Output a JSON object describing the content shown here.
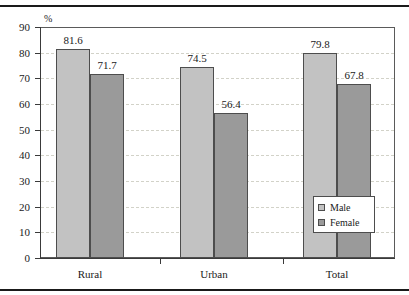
{
  "chart_data": {
    "type": "bar",
    "title": "",
    "xlabel": "",
    "ylabel": "%",
    "ylim": [
      0,
      90
    ],
    "ytick_step": 10,
    "yticks": [
      "90",
      "80",
      "70",
      "60",
      "50",
      "40",
      "30",
      "20",
      "10",
      "0"
    ],
    "grid": true,
    "legend_position": "inside-bottom-right",
    "categories": [
      "Rural",
      "Urban",
      "Total"
    ],
    "series": [
      {
        "name": "Male",
        "values": [
          81.6,
          74.5,
          79.8
        ],
        "color": "#c2c2c2"
      },
      {
        "name": "Female",
        "values": [
          71.7,
          56.4,
          67.8
        ],
        "color": "#9a9a9a"
      }
    ],
    "value_labels": [
      "81.6",
      "71.7",
      "74.5",
      "56.4",
      "79.8",
      "67.8"
    ]
  },
  "axis": {
    "unit_label": "%"
  },
  "legend": {
    "items": [
      {
        "label": "Male"
      },
      {
        "label": "Female"
      }
    ]
  }
}
